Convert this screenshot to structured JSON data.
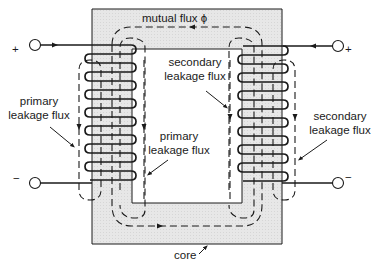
{
  "diagram": {
    "type": "transformer-flux-diagram",
    "colors": {
      "core_fill": "#e6e6e6",
      "line": "#1a1a1a",
      "background": "#ffffff"
    },
    "labels": {
      "mutual_flux": "mutual flux ϕ",
      "secondary_leakage_inner_1": "secondary",
      "secondary_leakage_inner_2": "leakage flux",
      "primary_leakage_inner_1": "primary",
      "primary_leakage_inner_2": "leakage flux",
      "primary_leakage_outer_1": "primary",
      "primary_leakage_outer_2": "leakage flux",
      "secondary_leakage_outer_1": "secondary",
      "secondary_leakage_outer_2": "leakage flux",
      "core": "core"
    },
    "terminals": {
      "primary_plus": "+",
      "primary_minus": "−",
      "secondary_plus": "+",
      "secondary_minus": "−"
    },
    "coils": {
      "primary_turns": 8,
      "secondary_turns": 8
    }
  }
}
